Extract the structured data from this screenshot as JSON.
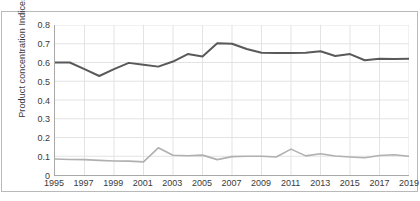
{
  "caption": {
    "text": "",
    "visible": false
  },
  "chart_data": {
    "type": "line",
    "title": "",
    "xlabel": "",
    "ylabel": "Product concentration Indices",
    "xlim": [
      1995,
      2019
    ],
    "ylim": [
      0,
      0.8
    ],
    "grid": true,
    "grid_color": "#e3e3e3",
    "legend": "none",
    "background": "#ffffff",
    "frame_color": "#b9b9b9",
    "axis_color": "#a9a9a9",
    "x": [
      1995,
      1996,
      1997,
      1998,
      1999,
      2000,
      2001,
      2002,
      2003,
      2004,
      2005,
      2006,
      2007,
      2008,
      2009,
      2010,
      2011,
      2012,
      2013,
      2014,
      2015,
      2016,
      2017,
      2018,
      2019
    ],
    "xticks": [
      "1995",
      "1997",
      "1999",
      "2001",
      "2003",
      "2005",
      "2007",
      "2009",
      "2011",
      "2013",
      "2015",
      "2017",
      "2019"
    ],
    "xtick_values": [
      1995,
      1997,
      1999,
      2001,
      2003,
      2005,
      2007,
      2009,
      2011,
      2013,
      2015,
      2017,
      2019
    ],
    "yticks": [
      "0.8",
      "0.7",
      "0.6",
      "0.5",
      "0.4",
      "0.3",
      "0.2",
      "0.1",
      "0"
    ],
    "ytick_values": [
      0.8,
      0.7,
      0.6,
      0.5,
      0.4,
      0.3,
      0.2,
      0.1,
      0
    ],
    "series": [
      {
        "name": "upper-series",
        "color": "#595959",
        "width": 2.0,
        "values": [
          0.6,
          0.6,
          0.565,
          0.528,
          0.565,
          0.598,
          0.588,
          0.578,
          0.605,
          0.645,
          0.632,
          0.703,
          0.7,
          0.672,
          0.652,
          0.65,
          0.65,
          0.652,
          0.66,
          0.635,
          0.645,
          0.612,
          0.62,
          0.618,
          0.62
        ]
      },
      {
        "name": "lower-series",
        "color": "#b0b0b0",
        "width": 1.6,
        "values": [
          0.085,
          0.083,
          0.082,
          0.078,
          0.075,
          0.074,
          0.07,
          0.145,
          0.105,
          0.103,
          0.106,
          0.082,
          0.098,
          0.1,
          0.1,
          0.096,
          0.138,
          0.102,
          0.113,
          0.101,
          0.096,
          0.092,
          0.104,
          0.108,
          0.1
        ]
      }
    ]
  }
}
